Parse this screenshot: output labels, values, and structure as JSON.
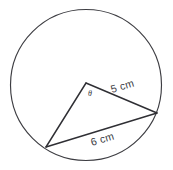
{
  "figure": {
    "background_color": "#ffffff",
    "stroke_color": "#2f2f34",
    "circle_stroke_color": "#3d3d42",
    "text_color": "#3a3a3f",
    "labels": {
      "radius_label": "5 cm",
      "chord_label": "6 cm",
      "angle_label": "θ"
    },
    "geometry": {
      "circle": {
        "cx": 86,
        "cy": 85,
        "r": 75.5
      },
      "center_vertex": {
        "x": 86,
        "y": 83
      },
      "left_vertex": {
        "x": 46,
        "y": 147
      },
      "right_vertex": {
        "x": 157,
        "y": 113
      },
      "radius_label_rotation_deg": -17,
      "chord_label_rotation_deg": -17,
      "radius_label_pos": {
        "x": 112,
        "y": 93
      },
      "chord_label_pos": {
        "x": 92,
        "y": 146
      },
      "angle_label_pos": {
        "x": 88,
        "y": 96
      }
    }
  }
}
